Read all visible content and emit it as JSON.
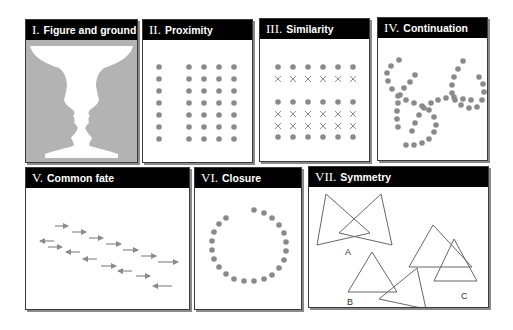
{
  "colors": {
    "dot": "#8a8a8a",
    "header_bg": "#000000",
    "header_text": "#ffffff",
    "silhouette": "#b3b3b3",
    "line": "#555555"
  },
  "panels": [
    {
      "numeral": "I.",
      "title": "Figure and ground"
    },
    {
      "numeral": "II.",
      "title": "Proximity"
    },
    {
      "numeral": "III.",
      "title": "Similarity"
    },
    {
      "numeral": "IV.",
      "title": "Continuation"
    },
    {
      "numeral": "V.",
      "title": "Common fate"
    },
    {
      "numeral": "VI.",
      "title": "Closure"
    },
    {
      "numeral": "VII.",
      "title": "Symmetry",
      "labels": [
        "A",
        "B",
        "C"
      ]
    }
  ]
}
